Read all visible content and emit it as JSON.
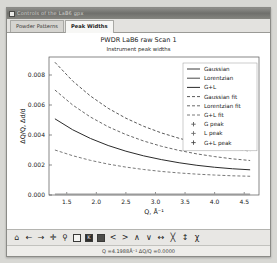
{
  "window": {
    "title": "Controls of the LaB6 gpx"
  },
  "tabs": [
    {
      "label": "Powder Patterns",
      "active": false
    },
    {
      "label": "Peak Widths",
      "active": true
    }
  ],
  "plot": {
    "title": "PWDR LaB6 raw Scan 1",
    "subtitle": "Instrument peak widths"
  },
  "toolbar": {
    "items": [
      {
        "name": "home-icon",
        "glyph": "⌂"
      },
      {
        "name": "back-arrow-icon",
        "glyph": "←"
      },
      {
        "name": "forward-arrow-icon",
        "glyph": "→"
      },
      {
        "name": "pan-move-icon",
        "glyph": "✛"
      },
      {
        "name": "zoom-magnifier-icon",
        "glyph": "⚲"
      },
      {
        "name": "configure-subplots-icon",
        "glyph": "▤"
      },
      {
        "name": "save-figure-icon",
        "glyph": "K"
      },
      {
        "name": "copy-figure-icon",
        "glyph": "■"
      },
      {
        "name": "previous-peak-icon",
        "glyph": "<"
      },
      {
        "name": "next-peak-icon",
        "glyph": ">"
      },
      {
        "name": "move-up-icon",
        "glyph": "∧"
      },
      {
        "name": "move-down-icon",
        "glyph": "∨"
      },
      {
        "name": "expand-horizontal-icon",
        "glyph": "↔"
      },
      {
        "name": "shrink-horizontal-icon",
        "glyph": "╳"
      },
      {
        "name": "vertical-scale-icon",
        "glyph": "↕"
      },
      {
        "name": "chi-icon",
        "glyph": "χ"
      }
    ]
  },
  "status": {
    "text": "Q =4.1988Å⁻¹  ΔQ/Q =0.0000"
  },
  "chart_data": {
    "type": "line",
    "title": "PWDR LaB6 raw Scan 1",
    "subtitle": "Instrument peak widths",
    "xlabel": "Q, Å⁻¹",
    "ylabel": "ΔQ/Q, Δd/d",
    "xlim": [
      1.2,
      4.75
    ],
    "ylim": [
      0.0,
      0.0092
    ],
    "xticks": [
      1.5,
      2.0,
      2.5,
      3.0,
      3.5,
      4.0,
      4.5
    ],
    "yticks": [
      0.0,
      0.002,
      0.004,
      0.006,
      0.008
    ],
    "grid": false,
    "legend_position": "upper right",
    "x": [
      1.3,
      1.6,
      1.9,
      2.2,
      2.5,
      2.8,
      3.1,
      3.4,
      3.7,
      4.0,
      4.3,
      4.6
    ],
    "series": [
      {
        "name": "Gaussian",
        "style": "solid",
        "color": "#3a3a3a",
        "visible_in_plot": false,
        "values": [
          0.0,
          0.0,
          0.0,
          0.0,
          0.0,
          0.0,
          0.0,
          0.0,
          0.0,
          0.0,
          0.0,
          0.0
        ]
      },
      {
        "name": "Lorentzian",
        "style": "solid",
        "color": "#4a4a4a",
        "visible_in_plot": false,
        "values": [
          0.0,
          0.0,
          0.0,
          0.0,
          0.0,
          0.0,
          0.0,
          0.0,
          0.0,
          0.0,
          0.0,
          0.0
        ]
      },
      {
        "name": "G+L",
        "style": "solid",
        "color": "#2b2b2b",
        "visible_in_plot": true,
        "values": [
          0.00508,
          0.00435,
          0.00377,
          0.0033,
          0.00292,
          0.00261,
          0.00236,
          0.00215,
          0.00198,
          0.00185,
          0.00175,
          0.00168
        ]
      },
      {
        "name": "Gaussian fit",
        "style": "dashed",
        "color": "#5a5a5a",
        "visible_in_plot": true,
        "values": [
          0.00885,
          0.0076,
          0.0066,
          0.00578,
          0.00512,
          0.00458,
          0.00414,
          0.00378,
          0.00348,
          0.00325,
          0.00307,
          0.00293
        ]
      },
      {
        "name": "Lorentzian fit",
        "style": "dashed",
        "color": "#6a6a6a",
        "visible_in_plot": true,
        "values": [
          0.007,
          0.006,
          0.0052,
          0.00455,
          0.00403,
          0.0036,
          0.00325,
          0.00297,
          0.00274,
          0.00256,
          0.00241,
          0.0023
        ]
      },
      {
        "name": "G+L fit",
        "style": "dashed",
        "color": "#7a7a7a",
        "visible_in_plot": true,
        "values": [
          0.003,
          0.00262,
          0.00231,
          0.00206,
          0.00186,
          0.0017,
          0.00157,
          0.00147,
          0.00139,
          0.00133,
          0.00128,
          0.00125
        ]
      },
      {
        "name": "baseline",
        "style": "solid",
        "color": "#9a9a9a",
        "visible_in_plot": true,
        "values": [
          4e-05,
          4e-05,
          4e-05,
          4e-05,
          4e-05,
          4e-05,
          4e-05,
          4e-05,
          4e-05,
          4e-05,
          4e-05,
          4e-05
        ]
      }
    ],
    "legend": [
      {
        "label": "Gaussian",
        "kind": "line",
        "style": "solid",
        "color": "#3a3a3a"
      },
      {
        "label": "Lorentzian",
        "kind": "line",
        "style": "solid",
        "color": "#4a4a4a"
      },
      {
        "label": "G+L",
        "kind": "line",
        "style": "solid",
        "color": "#2b2b2b"
      },
      {
        "label": "Gaussian fit",
        "kind": "line",
        "style": "dashed",
        "color": "#5a5a5a"
      },
      {
        "label": "Lorentzian fit",
        "kind": "line",
        "style": "dashed",
        "color": "#6a6a6a"
      },
      {
        "label": "G+L fit",
        "kind": "line",
        "style": "dashed",
        "color": "#7a7a7a"
      },
      {
        "label": "G peak",
        "kind": "marker",
        "style": "plus",
        "color": "#5a5a5a"
      },
      {
        "label": "L peak",
        "kind": "marker",
        "style": "plus",
        "color": "#6a6a6a"
      },
      {
        "label": "G+L peak",
        "kind": "marker",
        "style": "plus",
        "color": "#4a4a4a"
      }
    ]
  }
}
